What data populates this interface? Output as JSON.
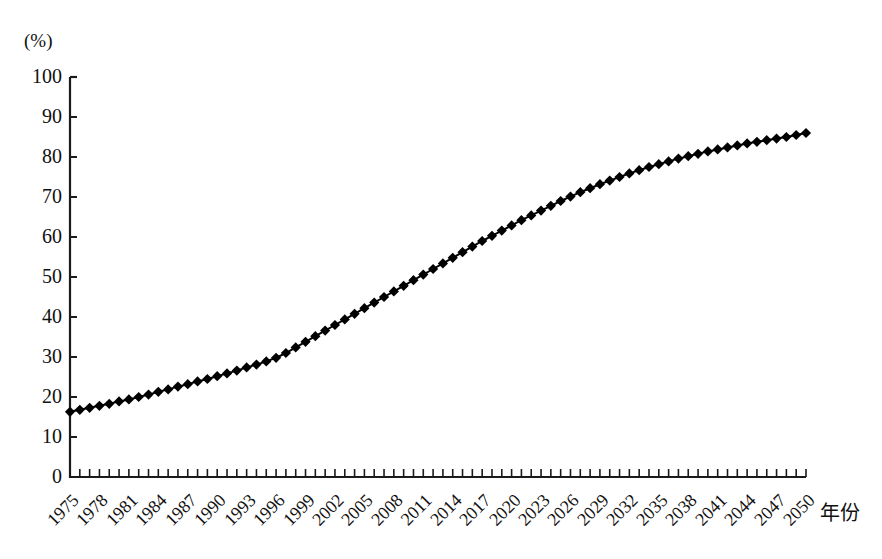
{
  "chart_data": {
    "type": "line",
    "title": "",
    "subtitle": "",
    "xlabel": "年份",
    "ylabel": "(%)",
    "unit_label": "(%)",
    "ylim": [
      0,
      100
    ],
    "xlim": [
      1975,
      2050
    ],
    "y_ticks": [
      "0",
      "10",
      "20",
      "30",
      "40",
      "50",
      "60",
      "70",
      "80",
      "90",
      "100"
    ],
    "y_tick_values": [
      0,
      10,
      20,
      30,
      40,
      50,
      60,
      70,
      80,
      90,
      100
    ],
    "x_tick_labels": [
      "1975",
      "1978",
      "1981",
      "1984",
      "1987",
      "1990",
      "1993",
      "1996",
      "1999",
      "2002",
      "2005",
      "2008",
      "2011",
      "2014",
      "2017",
      "2020",
      "2023",
      "2026",
      "2029",
      "2032",
      "2035",
      "2038",
      "2041",
      "2044",
      "2047",
      "2050"
    ],
    "x_tick_label_values": [
      1975,
      1978,
      1981,
      1984,
      1987,
      1990,
      1993,
      1996,
      1999,
      2002,
      2005,
      2008,
      2011,
      2014,
      2017,
      2020,
      2023,
      2026,
      2029,
      2032,
      2035,
      2038,
      2041,
      2044,
      2047,
      2050
    ],
    "x_minor_tick_step": 1,
    "grid": false,
    "legend": null,
    "legend_position": "none",
    "marker": "diamond",
    "marker_color": "#000000",
    "line_color": "#000000",
    "x": [
      1975,
      1976,
      1977,
      1978,
      1979,
      1980,
      1981,
      1982,
      1983,
      1984,
      1985,
      1986,
      1987,
      1988,
      1989,
      1990,
      1991,
      1992,
      1993,
      1994,
      1995,
      1996,
      1997,
      1998,
      1999,
      2000,
      2001,
      2002,
      2003,
      2004,
      2005,
      2006,
      2007,
      2008,
      2009,
      2010,
      2011,
      2012,
      2013,
      2014,
      2015,
      2016,
      2017,
      2018,
      2019,
      2020,
      2021,
      2022,
      2023,
      2024,
      2025,
      2026,
      2027,
      2028,
      2029,
      2030,
      2031,
      2032,
      2033,
      2034,
      2035,
      2036,
      2037,
      2038,
      2039,
      2040,
      2041,
      2042,
      2043,
      2044,
      2045,
      2046,
      2047,
      2048,
      2049,
      2050
    ],
    "values": [
      16.3,
      16.8,
      17.3,
      17.8,
      18.3,
      18.9,
      19.4,
      20.0,
      20.6,
      21.3,
      21.9,
      22.6,
      23.2,
      23.9,
      24.5,
      25.2,
      25.9,
      26.6,
      27.4,
      28.1,
      28.9,
      29.8,
      31.0,
      32.4,
      33.8,
      35.2,
      36.6,
      38.0,
      39.4,
      40.8,
      42.2,
      43.6,
      45.0,
      46.4,
      47.8,
      49.2,
      50.6,
      52.0,
      53.4,
      54.8,
      56.2,
      57.6,
      59.0,
      60.3,
      61.6,
      62.9,
      64.2,
      65.4,
      66.6,
      67.8,
      69.0,
      70.1,
      71.2,
      72.2,
      73.2,
      74.1,
      75.0,
      75.9,
      76.7,
      77.5,
      78.2,
      78.9,
      79.6,
      80.2,
      80.8,
      81.4,
      81.9,
      82.4,
      82.9,
      83.4,
      83.8,
      84.2,
      84.6,
      85.0,
      85.5,
      86.0
    ]
  },
  "axis": {
    "y_unit": "(%)",
    "x_title": "年份"
  }
}
